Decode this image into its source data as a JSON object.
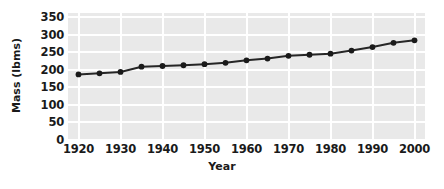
{
  "chart_data": {
    "type": "line",
    "title": "",
    "xlabel": "Year",
    "ylabel": "Mass (lbms)",
    "xlim": [
      1917.5,
      2002.5
    ],
    "ylim": [
      0,
      362
    ],
    "grid": true,
    "legend": "none",
    "marker": "filled-circle",
    "line_color": "#262626",
    "marker_color": "#1a1a1a",
    "plot_bg_color": "#e9e9e9",
    "gridline_color": "#ffffff",
    "x_ticks": [
      "1920",
      "1930",
      "1940",
      "1950",
      "1960",
      "1970",
      "1980",
      "1990",
      "2000"
    ],
    "y_ticks": [
      "0",
      "50",
      "100",
      "150",
      "200",
      "250",
      "300",
      "350"
    ],
    "x": [
      1920,
      1925,
      1930,
      1935,
      1940,
      1945,
      1950,
      1955,
      1960,
      1965,
      1970,
      1975,
      1980,
      1985,
      1990,
      1995,
      2000
    ],
    "values": [
      187,
      190,
      194,
      209,
      211,
      213,
      216,
      220,
      227,
      232,
      240,
      243,
      246,
      255,
      265,
      277,
      284
    ],
    "points": [
      {
        "x": 1920,
        "y": 187
      },
      {
        "x": 1925,
        "y": 190
      },
      {
        "x": 1930,
        "y": 194
      },
      {
        "x": 1935,
        "y": 209
      },
      {
        "x": 1940,
        "y": 211
      },
      {
        "x": 1945,
        "y": 213
      },
      {
        "x": 1950,
        "y": 216
      },
      {
        "x": 1955,
        "y": 220
      },
      {
        "x": 1960,
        "y": 227
      },
      {
        "x": 1965,
        "y": 232
      },
      {
        "x": 1970,
        "y": 240
      },
      {
        "x": 1975,
        "y": 243
      },
      {
        "x": 1980,
        "y": 246
      },
      {
        "x": 1985,
        "y": 255
      },
      {
        "x": 1990,
        "y": 265
      },
      {
        "x": 1995,
        "y": 277
      },
      {
        "x": 2000,
        "y": 284
      }
    ]
  }
}
